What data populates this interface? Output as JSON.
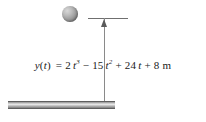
{
  "figure": {
    "background_color": "#ffffff",
    "width": 206,
    "height": 122
  },
  "ball": {
    "name": "sphere",
    "fill_light": "#d8d8d8",
    "fill_dark": "#6e6e6e",
    "diameter_px": 16
  },
  "datum_line": {
    "color": "#6f6f6f",
    "length_px": 40
  },
  "measure_line": {
    "color": "#8a8a8a",
    "length_px": 86,
    "arrow_direction": "up"
  },
  "ground": {
    "color_light": "#e6e6e6",
    "color_dark": "#7c7c7c",
    "length_px": 107
  },
  "equation": {
    "full_text": "y(t) = 2 t^3 - 15 t^2 + 24 t + 8 m",
    "lhs_function": "y",
    "lhs_open": "(",
    "lhs_arg": "t",
    "lhs_close": ")",
    "equals": "=",
    "term1_coeff": "2",
    "term1_var": "t",
    "term1_exp": "3",
    "op1": "−",
    "term2_coeff": "15",
    "term2_var": "t",
    "term2_exp": "2",
    "op2": "+",
    "term3_coeff": "24",
    "term3_var": "t",
    "op3": "+",
    "term4_coeff": "8",
    "units": "m"
  }
}
